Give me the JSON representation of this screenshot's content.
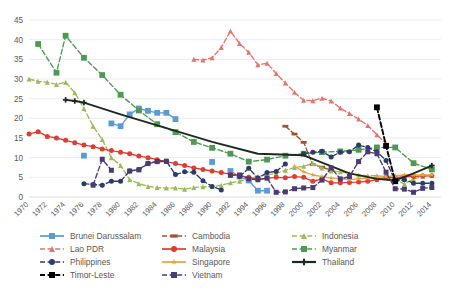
{
  "chart_data": {
    "type": "line",
    "title": "",
    "subtitle": "",
    "xlabel": "",
    "ylabel": "",
    "xlim": [
      1970,
      2015
    ],
    "ylim": [
      0,
      45
    ],
    "ytick_step": 5,
    "yticks": [
      "0",
      "5",
      "10",
      "15",
      "20",
      "25",
      "30",
      "35",
      "40",
      "45"
    ],
    "xticks": [
      "1970",
      "1972",
      "1974",
      "1976",
      "1978",
      "1980",
      "1982",
      "1984",
      "1986",
      "1988",
      "1990",
      "1992",
      "1994",
      "1996",
      "1998",
      "2000",
      "2002",
      "2004",
      "2006",
      "2008",
      "2010",
      "2012",
      "2014"
    ],
    "grid": "horizontal",
    "legend_position": "bottom",
    "series": [
      {
        "name": "Brunei Darussalam",
        "color": "#5B9BD5",
        "dash": "solid",
        "marker": "square",
        "x": [
          1976,
          1977,
          1978,
          1979,
          1980,
          1981,
          1982,
          1983,
          1984,
          1985,
          1986,
          1987,
          1988,
          1989,
          1990,
          1991,
          1992,
          1993,
          1994,
          1995,
          1996
        ],
        "y": [
          10.5,
          null,
          null,
          18.7,
          18.0,
          21.0,
          22.5,
          21.9,
          21.4,
          21.4,
          19.8,
          null,
          null,
          null,
          8.9,
          null,
          6.6,
          5.2,
          4.2,
          1.6,
          1.6
        ]
      },
      {
        "name": "Cambodia",
        "color": "#A0522D",
        "dash": "dashed",
        "marker": "bar",
        "x": [
          1998,
          1999,
          2000,
          2001,
          2002,
          2003
        ],
        "y": [
          18.0,
          16.0,
          13.9,
          8.2,
          7.6,
          6.8
        ]
      },
      {
        "name": "Indonesia",
        "color": "#9BBB59",
        "dash": "dashed",
        "marker": "triangle",
        "x": [
          1970,
          1971,
          1972,
          1973,
          1974,
          1975,
          1976,
          1977,
          1978,
          1979,
          1980,
          1981,
          1982,
          1983,
          1984,
          1985,
          1986,
          1987,
          1988,
          1989,
          1990,
          1991,
          1992,
          1993,
          1994,
          1995,
          1996,
          1997,
          1998,
          1999,
          2000,
          2001,
          2002,
          2003,
          2004,
          2005,
          2006,
          2007,
          2008,
          2009,
          2010,
          2011,
          2012,
          2013,
          2014
        ],
        "y": [
          30.0,
          29.4,
          29.2,
          28.6,
          29.2,
          26.5,
          22.5,
          18.0,
          14.6,
          10.0,
          8.0,
          4.4,
          3.4,
          2.7,
          2.4,
          2.3,
          2.3,
          2.0,
          2.4,
          2.6,
          2.6,
          3.0,
          3.6,
          4.0,
          4.6,
          5.3,
          5.6,
          6.0,
          6.8,
          7.5,
          7.8,
          8.5,
          7.4,
          6.6,
          6.4,
          6.0,
          5.6,
          5.4,
          5.4,
          5.2,
          4.4,
          3.3,
          4.6,
          5.2,
          5.6
        ]
      },
      {
        "name": "Lao PDR",
        "color": "#E8736A",
        "dash": "dashed",
        "marker": "triangle",
        "x": [
          1988,
          1989,
          1990,
          1991,
          1992,
          1993,
          1994,
          1995,
          1996,
          1997,
          1998,
          1999,
          2000,
          2001,
          2002,
          2003,
          2004,
          2005,
          2006,
          2007,
          2008,
          2009
        ],
        "y": [
          35.0,
          34.8,
          35.4,
          38.0,
          42.2,
          39.0,
          36.8,
          33.6,
          34.0,
          31.4,
          29.0,
          26.6,
          24.6,
          24.5,
          25.1,
          24.4,
          22.6,
          21.2,
          19.8,
          18.2,
          15.8,
          13.6
        ]
      },
      {
        "name": "Malaysia",
        "color": "#E03C31",
        "dash": "solid",
        "marker": "circle",
        "x": [
          1970,
          1971,
          1972,
          1973,
          1974,
          1975,
          1976,
          1977,
          1978,
          1979,
          1980,
          1981,
          1982,
          1983,
          1984,
          1985,
          1986,
          1987,
          1988,
          1989,
          1990,
          1991,
          1992,
          1993,
          1994,
          1995,
          1996,
          1997,
          1998,
          1999,
          2000,
          2001,
          2002,
          2003,
          2004,
          2005,
          2006,
          2007,
          2008,
          2009,
          2010,
          2011,
          2012,
          2013,
          2014
        ],
        "y": [
          16.0,
          16.6,
          15.4,
          15.0,
          14.4,
          13.8,
          13.2,
          12.8,
          12.2,
          11.8,
          11.4,
          11.0,
          10.4,
          10.0,
          9.5,
          9.0,
          8.5,
          8.0,
          7.4,
          7.0,
          6.6,
          6.2,
          5.8,
          5.4,
          5.0,
          4.4,
          4.8,
          5.0,
          4.9,
          5.2,
          5.0,
          4.0,
          4.6,
          3.6,
          3.6,
          3.7,
          3.8,
          4.0,
          4.4,
          5.0,
          4.9,
          5.2,
          5.2,
          5.4,
          5.4
        ]
      },
      {
        "name": "Myanmar",
        "color": "#4E9A52",
        "dash": "dashed",
        "marker": "square",
        "x": [
          1971,
          1973,
          1974,
          1976,
          1978,
          1980,
          1982,
          1984,
          1986,
          1988,
          1990,
          1992,
          1994,
          1996,
          1998,
          2000,
          2002,
          2004,
          2006,
          2008,
          2010,
          2012,
          2014
        ],
        "y": [
          38.9,
          31.6,
          41.0,
          35.4,
          31.0,
          26.0,
          22.0,
          18.5,
          16.5,
          14.0,
          12.5,
          11.0,
          9.0,
          9.5,
          10.5,
          11.0,
          11.4,
          11.6,
          12.0,
          12.6,
          12.6,
          8.6,
          7.0
        ]
      },
      {
        "name": "Philippines",
        "color": "#2E3A6B",
        "dash": "dashed",
        "marker": "circle",
        "x": [
          1976,
          1977,
          1978,
          1979,
          1980,
          1981,
          1982,
          1983,
          1984,
          1985,
          1986,
          1987,
          1988,
          1989,
          1990,
          1991,
          1992,
          1993,
          1994,
          1995,
          1996,
          1997,
          1998,
          1999,
          2000,
          2001,
          2002,
          2003,
          2004,
          2005,
          2006,
          2007,
          2008,
          2009,
          2010,
          2011,
          2012,
          2013,
          2014
        ],
        "y": [
          3.4,
          3.2,
          3.0,
          4.0,
          4.0,
          6.6,
          7.0,
          8.6,
          9.0,
          9.1,
          5.7,
          6.4,
          6.3,
          4.1,
          2.7,
          1.8,
          null,
          5.2,
          7.3,
          4.8,
          6.2,
          6.5,
          8.4,
          null,
          11.0,
          11.4,
          11.6,
          10.2,
          11.4,
          11.5,
          13.2,
          12.6,
          11.5,
          9.3,
          4.0,
          4.4,
          3.5,
          3.5,
          3.5
        ]
      },
      {
        "name": "Singapore",
        "color": "#E8A33D",
        "dash": "solid",
        "marker": "star",
        "x": [
          1999,
          2000,
          2001,
          2002,
          2003,
          2004,
          2005,
          2006,
          2007,
          2008,
          2009,
          2010,
          2011,
          2012,
          2013,
          2014
        ],
        "y": [
          7.8,
          6.4,
          5.6,
          5.2,
          4.8,
          4.6,
          4.4,
          4.6,
          4.8,
          5.0,
          5.2,
          5.4,
          5.6,
          5.6,
          5.6,
          5.6
        ]
      },
      {
        "name": "Thailand",
        "color": "#1C2B1E",
        "dash": "solid",
        "marker": "plus",
        "x": [
          1974,
          1975,
          1976,
          1980,
          1985,
          1990,
          1995,
          2000,
          2005,
          2008,
          2010,
          2012,
          2014
        ],
        "y": [
          24.7,
          24.4,
          24.0,
          21.0,
          17.5,
          14.0,
          11.0,
          10.6,
          6.0,
          4.6,
          4.2,
          6.0,
          8.0
        ]
      },
      {
        "name": "Timor-Leste",
        "color": "#000000",
        "dash": "dashed",
        "marker": "square",
        "x": [
          2008,
          2009,
          2010
        ],
        "y": [
          22.8,
          13.0,
          4.0
        ]
      },
      {
        "name": "Vietnam",
        "color": "#4B3B72",
        "dash": "dashed",
        "marker": "square",
        "x": [
          1977,
          1978,
          1979,
          1980,
          1981,
          1982,
          1983,
          1984,
          1985,
          1986,
          1987,
          1988,
          1989,
          1990,
          1991,
          1992,
          1993,
          1994,
          1995,
          1996,
          1997,
          1998,
          1999,
          2000,
          2001,
          2002,
          2003,
          2004,
          2005,
          2006,
          2007,
          2008,
          2009,
          2010,
          2011,
          2012,
          2013,
          2014
        ],
        "y": [
          3.0,
          9.6,
          6.8,
          null,
          6.6,
          6.9,
          8.5,
          9.0,
          9.1,
          null,
          null,
          null,
          null,
          null,
          null,
          5.5,
          5.6,
          4.6,
          4.4,
          4.8,
          1.2,
          1.3,
          2.1,
          2.3,
          2.4,
          4.3,
          7.4,
          4.6,
          5.2,
          9.0,
          11.5,
          11.0,
          6.3,
          2.1,
          2.0,
          1.2,
          2.2,
          2.4
        ]
      }
    ]
  },
  "legend": {
    "entries": [
      {
        "label": "Brunei Darussalam",
        "color": "#5B9BD5",
        "dash": "solid",
        "marker": "square"
      },
      {
        "label": "Cambodia",
        "color": "#A0522D",
        "dash": "dashed",
        "marker": "bar"
      },
      {
        "label": "Indonesia",
        "color": "#9BBB59",
        "dash": "dashed",
        "marker": "triangle"
      },
      {
        "label": "Lao PDR",
        "color": "#E8736A",
        "dash": "dashed",
        "marker": "triangle"
      },
      {
        "label": "Malaysia",
        "color": "#E03C31",
        "dash": "solid",
        "marker": "circle"
      },
      {
        "label": "Myanmar",
        "color": "#4E9A52",
        "dash": "dashed",
        "marker": "square"
      },
      {
        "label": "Philippines",
        "color": "#2E3A6B",
        "dash": "dashed",
        "marker": "circle"
      },
      {
        "label": "Singapore",
        "color": "#E8A33D",
        "dash": "solid",
        "marker": "star"
      },
      {
        "label": "Thailand",
        "color": "#1C2B1E",
        "dash": "solid",
        "marker": "plus"
      },
      {
        "label": "Timor-Leste",
        "color": "#000000",
        "dash": "dashed",
        "marker": "square"
      },
      {
        "label": "Vietnam",
        "color": "#4B3B72",
        "dash": "dashed",
        "marker": "square"
      }
    ]
  },
  "style": {
    "background": "#FFFFFF",
    "gridline_color": "#E8E8E8",
    "axis_color": "#D9D9D9",
    "text_color": "#595959"
  }
}
